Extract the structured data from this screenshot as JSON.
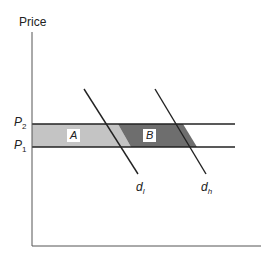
{
  "diagram": {
    "y_axis_label": "Price",
    "price_levels": [
      {
        "symbol": "P",
        "subscript": "2"
      },
      {
        "symbol": "P",
        "subscript": "1"
      }
    ],
    "areas": [
      {
        "label": "A",
        "color": "#c4c4c4"
      },
      {
        "label": "B",
        "color": "#6e6e6e"
      }
    ],
    "curves": [
      {
        "symbol": "d",
        "subscript": "l"
      },
      {
        "symbol": "d",
        "subscript": "h"
      }
    ],
    "colors": {
      "line": "#222222",
      "area_a": "#c4c4c4",
      "area_b": "#6e6e6e",
      "axis": "#555555"
    }
  }
}
